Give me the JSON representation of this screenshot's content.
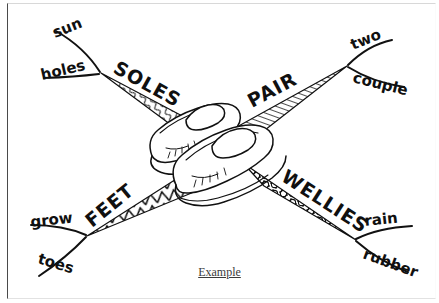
{
  "document": {
    "type": "word-web-worksheet",
    "caption": "Example",
    "background_color": "#ffffff",
    "ink_color": "#101010",
    "border_color": "#4a4a4a"
  },
  "central_image": {
    "name": "pair-of-shoes-drawing",
    "description": "line drawing of a pair of slip-on loafer shoes"
  },
  "spokes": [
    {
      "id": "soles",
      "label": "SOLES",
      "position": "top-left",
      "texture": "squiggle",
      "branches": [
        {
          "id": "sun",
          "label": "sun",
          "position": "upper"
        },
        {
          "id": "holes",
          "label": "holes",
          "position": "lower"
        }
      ]
    },
    {
      "id": "pair",
      "label": "PAIR",
      "position": "top-right",
      "texture": "diagonal-hatch",
      "branches": [
        {
          "id": "two",
          "label": "two",
          "position": "upper"
        },
        {
          "id": "couple",
          "label": "couple",
          "position": "lower"
        }
      ]
    },
    {
      "id": "feet",
      "label": "FEET",
      "position": "bottom-left",
      "texture": "zigzag",
      "branches": [
        {
          "id": "grow",
          "label": "grow",
          "position": "upper"
        },
        {
          "id": "toes",
          "label": "toes",
          "position": "lower"
        }
      ]
    },
    {
      "id": "wellies",
      "label": "WELLIES",
      "position": "bottom-right",
      "texture": "pebble",
      "branches": [
        {
          "id": "rain",
          "label": "rain",
          "position": "upper"
        },
        {
          "id": "rubber",
          "label": "rubber",
          "position": "lower"
        }
      ]
    }
  ]
}
